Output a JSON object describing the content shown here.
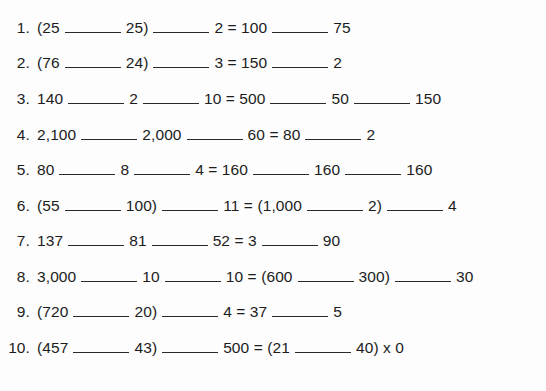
{
  "worksheet": {
    "background_color": "#fdfdfd",
    "text_color": "#1c1c1c",
    "rule_color": "#2a2a2a",
    "problems": [
      {
        "number": "1.",
        "segments": [
          {
            "type": "text",
            "value": "(25"
          },
          {
            "type": "blank",
            "width": "w-std"
          },
          {
            "type": "text",
            "value": "25)"
          },
          {
            "type": "blank",
            "width": "w-std"
          },
          {
            "type": "text",
            "value": "2 = 100"
          },
          {
            "type": "blank",
            "width": "w-std"
          },
          {
            "type": "text",
            "value": "75"
          }
        ]
      },
      {
        "number": "2.",
        "segments": [
          {
            "type": "text",
            "value": "(76"
          },
          {
            "type": "blank",
            "width": "w-std"
          },
          {
            "type": "text",
            "value": "24)"
          },
          {
            "type": "blank",
            "width": "w-std"
          },
          {
            "type": "text",
            "value": "3 = 150"
          },
          {
            "type": "blank",
            "width": "w-std"
          },
          {
            "type": "text",
            "value": "2"
          }
        ]
      },
      {
        "number": "3.",
        "segments": [
          {
            "type": "text",
            "value": "140"
          },
          {
            "type": "blank",
            "width": "w-std"
          },
          {
            "type": "text",
            "value": "2"
          },
          {
            "type": "blank",
            "width": "w-std"
          },
          {
            "type": "text",
            "value": "10 = 500"
          },
          {
            "type": "blank",
            "width": "w-std"
          },
          {
            "type": "text",
            "value": "50"
          },
          {
            "type": "blank",
            "width": "w-std"
          },
          {
            "type": "text",
            "value": "150"
          }
        ]
      },
      {
        "number": "4.",
        "segments": [
          {
            "type": "text",
            "value": "2,100"
          },
          {
            "type": "blank",
            "width": "w-std"
          },
          {
            "type": "text",
            "value": "2,000"
          },
          {
            "type": "blank",
            "width": "w-std"
          },
          {
            "type": "text",
            "value": "60 = 80"
          },
          {
            "type": "blank",
            "width": "w-std"
          },
          {
            "type": "text",
            "value": "2"
          }
        ]
      },
      {
        "number": "5.",
        "segments": [
          {
            "type": "text",
            "value": "80"
          },
          {
            "type": "blank",
            "width": "w-std"
          },
          {
            "type": "text",
            "value": "8"
          },
          {
            "type": "blank",
            "width": "w-std"
          },
          {
            "type": "text",
            "value": "4 = 160"
          },
          {
            "type": "blank",
            "width": "w-std"
          },
          {
            "type": "text",
            "value": "160"
          },
          {
            "type": "blank",
            "width": "w-std"
          },
          {
            "type": "text",
            "value": "160"
          }
        ]
      },
      {
        "number": "6.",
        "segments": [
          {
            "type": "text",
            "value": "(55"
          },
          {
            "type": "blank",
            "width": "w-std"
          },
          {
            "type": "text",
            "value": "100)"
          },
          {
            "type": "blank",
            "width": "w-std"
          },
          {
            "type": "text",
            "value": "11 = (1,000"
          },
          {
            "type": "blank",
            "width": "w-std"
          },
          {
            "type": "text",
            "value": "2)"
          },
          {
            "type": "blank",
            "width": "w-std"
          },
          {
            "type": "text",
            "value": "4"
          }
        ]
      },
      {
        "number": "7.",
        "segments": [
          {
            "type": "text",
            "value": "137"
          },
          {
            "type": "blank",
            "width": "w-std"
          },
          {
            "type": "text",
            "value": "81"
          },
          {
            "type": "blank",
            "width": "w-std"
          },
          {
            "type": "text",
            "value": "52 = 3"
          },
          {
            "type": "blank",
            "width": "w-std"
          },
          {
            "type": "text",
            "value": "90"
          }
        ]
      },
      {
        "number": "8.",
        "segments": [
          {
            "type": "text",
            "value": "3,000"
          },
          {
            "type": "blank",
            "width": "w-std"
          },
          {
            "type": "text",
            "value": "10"
          },
          {
            "type": "blank",
            "width": "w-std"
          },
          {
            "type": "text",
            "value": "10 = (600"
          },
          {
            "type": "blank",
            "width": "w-std"
          },
          {
            "type": "text",
            "value": "300)"
          },
          {
            "type": "blank",
            "width": "w-std"
          },
          {
            "type": "text",
            "value": "30"
          }
        ]
      },
      {
        "number": "9.",
        "segments": [
          {
            "type": "text",
            "value": "(720"
          },
          {
            "type": "blank",
            "width": "w-std"
          },
          {
            "type": "text",
            "value": "20)"
          },
          {
            "type": "blank",
            "width": "w-std"
          },
          {
            "type": "text",
            "value": "4 = 37"
          },
          {
            "type": "blank",
            "width": "w-std"
          },
          {
            "type": "text",
            "value": "5"
          }
        ]
      },
      {
        "number": "10.",
        "segments": [
          {
            "type": "text",
            "value": "(457"
          },
          {
            "type": "blank",
            "width": "w-std"
          },
          {
            "type": "text",
            "value": "43)"
          },
          {
            "type": "blank",
            "width": "w-std"
          },
          {
            "type": "text",
            "value": "500 = (21"
          },
          {
            "type": "blank",
            "width": "w-std"
          },
          {
            "type": "text",
            "value": "40) x 0"
          }
        ]
      }
    ]
  }
}
